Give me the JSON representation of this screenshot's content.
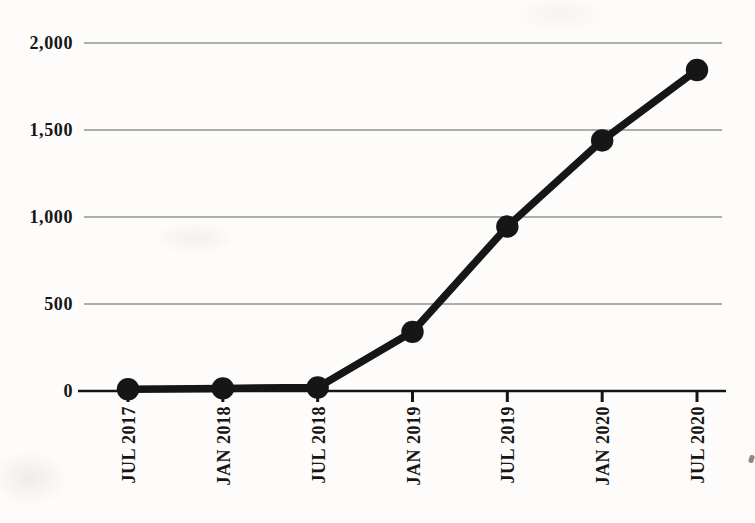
{
  "page": {
    "background_color": "#fdfcfa",
    "ink_color": "#161616",
    "gridline_color": "#454545",
    "title": ""
  },
  "chart_data": {
    "type": "line",
    "title": "",
    "xlabel": "",
    "ylabel": "",
    "categories": [
      "JUL 2017",
      "JAN 2018",
      "JUL 2018",
      "JAN 2019",
      "JUL 2019",
      "JAN 2020",
      "JUL 2020"
    ],
    "values": [
      10,
      15,
      20,
      340,
      945,
      1440,
      1845
    ],
    "ylim": [
      0,
      2000
    ],
    "yticks": [
      {
        "value": 0,
        "label": "0"
      },
      {
        "value": 500,
        "label": "500"
      },
      {
        "value": 1000,
        "label": "1,000"
      },
      {
        "value": 1500,
        "label": "1,500"
      },
      {
        "value": 2000,
        "label": "2,000"
      }
    ],
    "grid": true,
    "legend": false,
    "line_color": "#161616",
    "marker": "circle",
    "marker_color": "#161616",
    "x_tick_label_rotation": -90
  }
}
